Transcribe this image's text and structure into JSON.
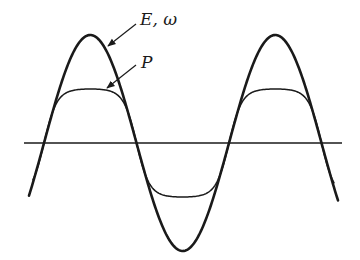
{
  "diagram": {
    "labels": {
      "e_omega": "E, ω",
      "p": "P"
    },
    "curves": [
      {
        "name": "E, ω",
        "style": "thick",
        "amplitude_px": 108,
        "peaks_x": [
          91,
          276
        ],
        "trough_x": 183
      },
      {
        "name": "P",
        "style": "thin",
        "amplitude_px": 54,
        "flattened_tops": true
      }
    ],
    "axis": {
      "y": 143,
      "x_start": 24,
      "x_end": 342
    },
    "colors": {
      "stroke": "#1a1a1a",
      "background": "#ffffff"
    }
  }
}
